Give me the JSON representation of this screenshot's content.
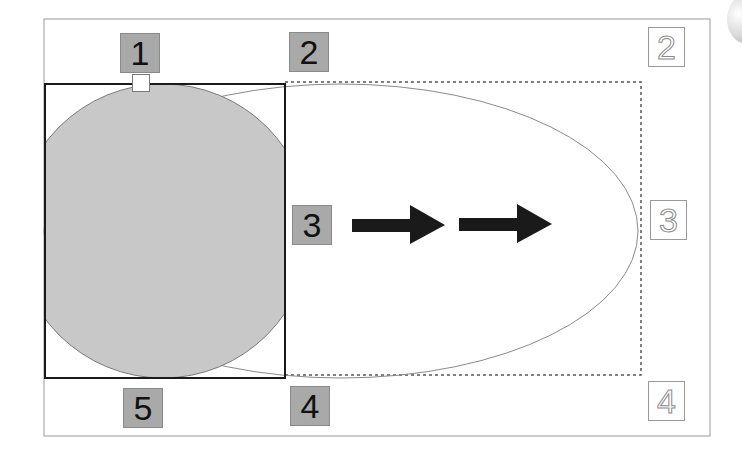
{
  "diagram": {
    "title": "",
    "colors": {
      "background": "#ffffff",
      "frame": "#9a9a9a",
      "square_stroke": "#1a1a1a",
      "circle_fill": "#c8c8c8",
      "circle_stroke": "#7a7a7a",
      "ellipse_stroke": "#8a8a8a",
      "dashed_stroke": "#555555",
      "arrow_fill": "#1a1a1a",
      "label_fill": "#a9a9a9"
    },
    "filled_labels": [
      {
        "id": "1",
        "text": "1"
      },
      {
        "id": "2",
        "text": "2"
      },
      {
        "id": "3",
        "text": "3"
      },
      {
        "id": "4",
        "text": "4"
      },
      {
        "id": "5",
        "text": "5"
      }
    ],
    "outline_labels": [
      {
        "id": "2",
        "text": "2"
      },
      {
        "id": "3",
        "text": "3"
      },
      {
        "id": "4",
        "text": "4"
      }
    ],
    "shapes": {
      "outer_frame": "rectangle",
      "solid_square": "square bounding box",
      "circle": "filled gray circle",
      "ellipse": "stretched ellipse outline",
      "dashed_rect": "dashed target bounding box",
      "arrows": [
        "right-arrow",
        "right-arrow"
      ]
    }
  }
}
